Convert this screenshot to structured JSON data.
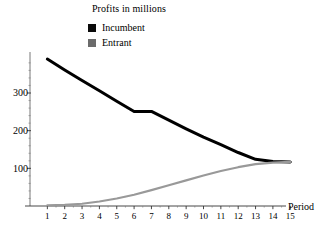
{
  "title": "Profits in millions",
  "legend": {
    "position": "top-center",
    "items": [
      {
        "label": "Incumbent",
        "color": "#000000",
        "swatch": "filled-square"
      },
      {
        "label": "Entrant",
        "color": "#808080",
        "swatch": "filled-square"
      }
    ]
  },
  "axes": {
    "x_name": "Period",
    "y_ticks": [
      "100",
      "200",
      "300"
    ],
    "x_ticks": [
      "1",
      "2",
      "3",
      "4",
      "5",
      "6",
      "7",
      "8",
      "9",
      "10",
      "11",
      "12",
      "13",
      "14",
      "15"
    ]
  },
  "chart_data": {
    "type": "line",
    "title": "Profits in millions",
    "xlabel": "Period",
    "ylabel": "",
    "x": [
      1,
      2,
      3,
      4,
      5,
      6,
      7,
      8,
      9,
      10,
      11,
      12,
      13,
      14,
      15
    ],
    "xlim": [
      0.4,
      15.6
    ],
    "ylim": [
      0,
      400
    ],
    "yticks": [
      100,
      200,
      300
    ],
    "grid": false,
    "legend_position": "top-center",
    "series": [
      {
        "name": "Incumbent",
        "color": "#000000",
        "values": [
          390,
          361,
          333,
          306,
          278,
          251,
          251,
          228,
          205,
          183,
          163,
          142,
          124,
          118,
          117
        ]
      },
      {
        "name": "Entrant",
        "color": "#999999",
        "values": [
          2,
          3,
          6,
          12,
          20,
          30,
          42,
          55,
          68,
          81,
          93,
          103,
          111,
          115,
          117
        ]
      }
    ]
  }
}
